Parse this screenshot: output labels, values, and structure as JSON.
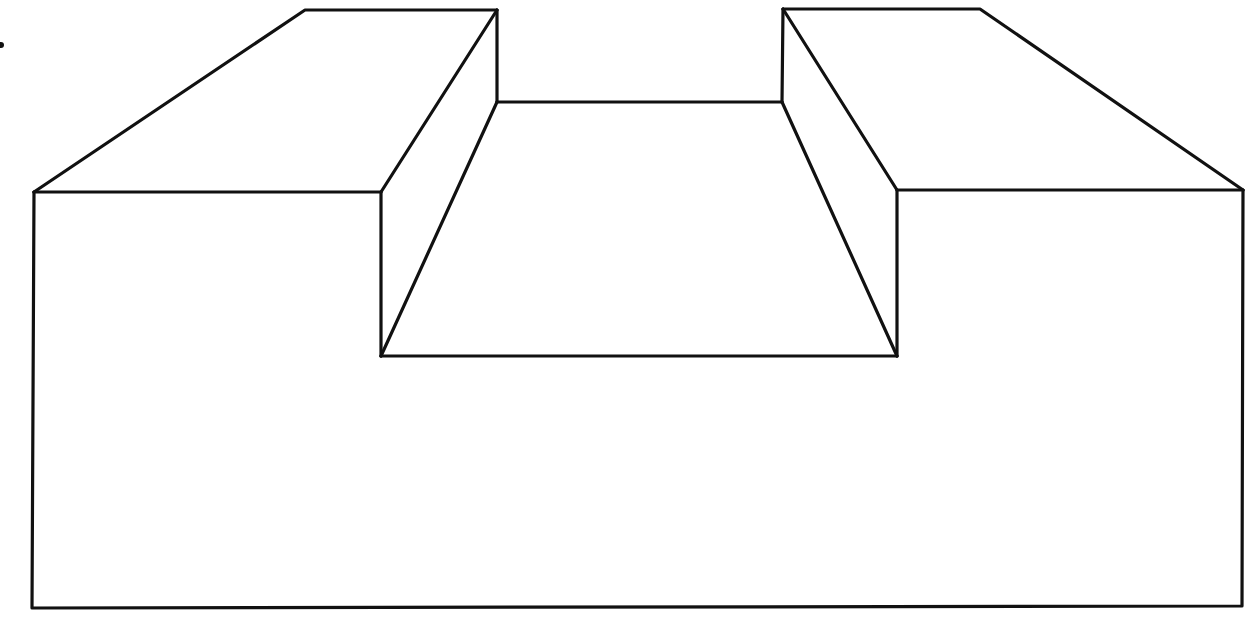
{
  "diagram": {
    "stroke_color": "#111111",
    "background": "#ffffff",
    "vertices": {
      "front_top_left": [
        34,
        192
      ],
      "front_top_right": [
        1243,
        190
      ],
      "front_bottom_left": [
        32,
        608
      ],
      "front_bottom_right": [
        1242,
        606
      ],
      "left_block_back_left": [
        305,
        10
      ],
      "left_block_back_right": [
        497,
        10
      ],
      "left_block_front_inner": [
        381,
        192
      ],
      "right_block_back_left": [
        783,
        9
      ],
      "right_block_back_right": [
        980,
        9
      ],
      "right_block_front_inner": [
        897,
        190
      ],
      "channel_back_left": [
        497,
        102
      ],
      "channel_back_right": [
        782,
        102
      ],
      "channel_front_left": [
        381,
        356
      ],
      "channel_front_right": [
        897,
        356
      ]
    },
    "marks": [
      {
        "name": "dot",
        "position": [
          1,
          45
        ]
      }
    ]
  }
}
